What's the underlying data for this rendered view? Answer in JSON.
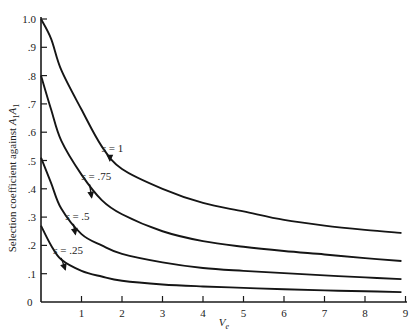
{
  "chart_data": {
    "type": "line",
    "title": "",
    "xlabel": "V_e",
    "ylabel": "Selection coefficient against A1A1",
    "xlim": [
      0,
      9
    ],
    "ylim": [
      0,
      1.0
    ],
    "grid": false,
    "legend": "inline labels with arrows",
    "x_ticks": [
      "1",
      "2",
      "3",
      "4",
      "5",
      "6",
      "7",
      "8",
      "9"
    ],
    "y_ticks": [
      "0",
      ".1",
      ".2",
      ".3",
      ".4",
      ".5",
      ".6",
      ".7",
      ".8",
      ".9",
      "1.0"
    ],
    "x": [
      0,
      0.25,
      0.5,
      1,
      1.5,
      2,
      3,
      4,
      5,
      6,
      7,
      8,
      8.9
    ],
    "series": [
      {
        "name": "s = 1",
        "label_prefix": "s",
        "label_value": "= 1",
        "values": [
          1.0,
          0.93,
          0.82,
          0.68,
          0.55,
          0.47,
          0.4,
          0.35,
          0.32,
          0.29,
          0.27,
          0.255,
          0.244
        ]
      },
      {
        "name": "s = .75",
        "label_prefix": "s",
        "label_value": "= .75",
        "values": [
          0.8,
          0.68,
          0.57,
          0.45,
          0.36,
          0.31,
          0.25,
          0.215,
          0.195,
          0.18,
          0.168,
          0.155,
          0.145
        ]
      },
      {
        "name": "s = .5",
        "label_prefix": "s",
        "label_value": "= .5",
        "values": [
          0.51,
          0.42,
          0.33,
          0.24,
          0.2,
          0.17,
          0.14,
          0.12,
          0.11,
          0.102,
          0.094,
          0.087,
          0.081
        ]
      },
      {
        "name": "s = .25",
        "label_prefix": "s",
        "label_value": "= .25",
        "values": [
          0.27,
          0.2,
          0.15,
          0.11,
          0.09,
          0.075,
          0.062,
          0.055,
          0.05,
          0.045,
          0.041,
          0.038,
          0.035
        ]
      }
    ],
    "annotations": [
      {
        "series": "s = 1",
        "label_x": 1.65,
        "label_y": 0.53,
        "arrow_to_x": 1.7,
        "arrow_to_y": 0.5
      },
      {
        "series": "s = .75",
        "label_x": 1.15,
        "label_y": 0.43,
        "arrow_to_x": 1.25,
        "arrow_to_y": 0.37
      },
      {
        "series": "s = .5",
        "label_x": 0.75,
        "label_y": 0.29,
        "arrow_to_x": 0.85,
        "arrow_to_y": 0.24
      },
      {
        "series": "s = .25",
        "label_x": 0.45,
        "label_y": 0.17,
        "arrow_to_x": 0.6,
        "arrow_to_y": 0.115
      }
    ]
  },
  "axes": {
    "xlabel_main": "V",
    "xlabel_sub": "e",
    "ylabel_text": "Selection coefficient against ",
    "ylabel_allele": "A",
    "ylabel_sub1": "1",
    "ylabel_allele2": "A",
    "ylabel_sub2": "1",
    "origin_label": "0"
  }
}
